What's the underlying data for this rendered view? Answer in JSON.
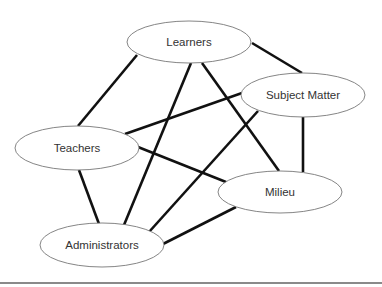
{
  "diagram": {
    "type": "network",
    "nodes": [
      {
        "id": "learners",
        "label": "Learners",
        "cx": 189,
        "cy": 42,
        "rx": 62,
        "ry": 21
      },
      {
        "id": "subject_matter",
        "label": "Subject Matter",
        "cx": 303,
        "cy": 95,
        "rx": 62,
        "ry": 22
      },
      {
        "id": "teachers",
        "label": "Teachers",
        "cx": 77,
        "cy": 148,
        "rx": 62,
        "ry": 22
      },
      {
        "id": "milieu",
        "label": "Milieu",
        "cx": 280,
        "cy": 192,
        "rx": 62,
        "ry": 21
      },
      {
        "id": "administrators",
        "label": "Administrators",
        "cx": 102,
        "cy": 245,
        "rx": 62,
        "ry": 22
      }
    ],
    "edges": [
      {
        "from": "learners",
        "to": "teachers",
        "x1": 137,
        "y1": 55,
        "x2": 78,
        "y2": 126
      },
      {
        "from": "learners",
        "to": "subject_matter",
        "x1": 252,
        "y1": 43,
        "x2": 302,
        "y2": 73
      },
      {
        "from": "learners",
        "to": "administrators",
        "x1": 191,
        "y1": 63,
        "x2": 124,
        "y2": 225
      },
      {
        "from": "learners",
        "to": "milieu",
        "x1": 202,
        "y1": 63,
        "x2": 279,
        "y2": 171
      },
      {
        "from": "teachers",
        "to": "subject_matter",
        "x1": 125,
        "y1": 134,
        "x2": 242,
        "y2": 93
      },
      {
        "from": "teachers",
        "to": "milieu",
        "x1": 138,
        "y1": 147,
        "x2": 226,
        "y2": 182
      },
      {
        "from": "teachers",
        "to": "administrators",
        "x1": 79,
        "y1": 170,
        "x2": 99,
        "y2": 224
      },
      {
        "from": "subject_matter",
        "to": "milieu",
        "x1": 303,
        "y1": 117,
        "x2": 303,
        "y2": 172
      },
      {
        "from": "subject_matter",
        "to": "administrators",
        "x1": 258,
        "y1": 111,
        "x2": 149,
        "y2": 232
      },
      {
        "from": "milieu",
        "to": "administrators",
        "x1": 236,
        "y1": 207,
        "x2": 163,
        "y2": 244
      }
    ]
  },
  "colors": {
    "edge": "#111111",
    "node_border": "#777777",
    "node_fill": "#ffffff",
    "label": "#333333",
    "rule": "#8a8a8a"
  }
}
